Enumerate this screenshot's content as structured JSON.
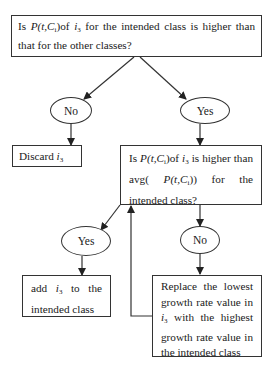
{
  "diagram": {
    "type": "flowchart",
    "nodes": {
      "decision1": {
        "kind": "decision-box",
        "pre": "Is ",
        "expr": "P(t,C",
        "expr_sub": "i",
        "expr_close": ")",
        "mid": "of ",
        "var": "i",
        "var_sub": "3",
        "post": " for the intended class is higher than that for the other classes?"
      },
      "no1": {
        "kind": "ellipse",
        "label": "No"
      },
      "yes1": {
        "kind": "ellipse",
        "label": "Yes"
      },
      "discard": {
        "kind": "action-box",
        "text": "Discard ",
        "var": "i",
        "var_sub": "3"
      },
      "decision2": {
        "kind": "decision-box",
        "pre": "Is ",
        "expr": "P(t,C",
        "expr_sub": "i",
        "expr_close": ")",
        "mid": "of ",
        "var": "i",
        "var_sub": "3",
        "post1": " is higher than avg( ",
        "expr2": "P(t,C",
        "expr2_sub": "i",
        "expr2_close": "))",
        "post2": " for the intended class?"
      },
      "yes2": {
        "kind": "ellipse",
        "label": "Yes"
      },
      "no2": {
        "kind": "ellipse",
        "label": "No"
      },
      "add": {
        "kind": "action-box",
        "pre": "add ",
        "var": "i",
        "var_sub": "3",
        "post": " to the intended class"
      },
      "replace": {
        "kind": "action-box",
        "pre": "Replace the lowest growth rate value in ",
        "var": "i",
        "var_sub": "3",
        "post": " with the highest growth rate value in the intended class"
      }
    },
    "edges": [
      {
        "from": "decision1",
        "to": "no1"
      },
      {
        "from": "decision1",
        "to": "yes1"
      },
      {
        "from": "no1",
        "to": "discard"
      },
      {
        "from": "yes1",
        "to": "decision2"
      },
      {
        "from": "decision2",
        "to": "yes2"
      },
      {
        "from": "decision2",
        "to": "no2"
      },
      {
        "from": "yes2",
        "to": "add"
      },
      {
        "from": "no2",
        "to": "replace"
      },
      {
        "from": "replace",
        "to": "decision2",
        "kind": "loop-back"
      }
    ],
    "colors": {
      "stroke": "#333333",
      "background": "#ffffff",
      "text": "#1a1a1a"
    }
  }
}
